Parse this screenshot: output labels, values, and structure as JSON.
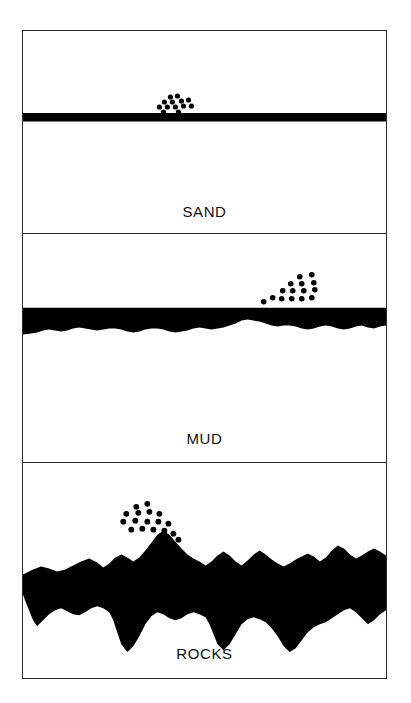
{
  "figure": {
    "background_color": "#ffffff",
    "frame_color": "#2b2b2b",
    "substrate_color": "#000000",
    "organism_color": "#000000",
    "panel_count": 3
  },
  "panels": [
    {
      "id": "sand",
      "label": "SAND",
      "substrate_type": "flat-band",
      "substrate_description": "Straight uniform black band representing a smooth sand bed",
      "organism_count": 13,
      "organism_cluster_position": "upper-center-left",
      "dots": [
        {
          "cx": 169,
          "cy": 96,
          "r": 2.6
        },
        {
          "cx": 176,
          "cy": 95,
          "r": 2.6
        },
        {
          "cx": 163,
          "cy": 101,
          "r": 2.6
        },
        {
          "cx": 171,
          "cy": 101,
          "r": 2.6
        },
        {
          "cx": 180,
          "cy": 100,
          "r": 2.6
        },
        {
          "cx": 187,
          "cy": 99,
          "r": 2.6
        },
        {
          "cx": 158,
          "cy": 106,
          "r": 2.6
        },
        {
          "cx": 166,
          "cy": 106,
          "r": 2.6
        },
        {
          "cx": 174,
          "cy": 106,
          "r": 2.6
        },
        {
          "cx": 182,
          "cy": 105,
          "r": 2.6
        },
        {
          "cx": 190,
          "cy": 105,
          "r": 2.6
        },
        {
          "cx": 162,
          "cy": 111,
          "r": 2.6
        },
        {
          "cx": 177,
          "cy": 111,
          "r": 2.6
        }
      ]
    },
    {
      "id": "mud",
      "label": "MUD",
      "substrate_type": "gently-undulating-band",
      "substrate_description": "Black band with a flat top and a softly rippled lower margin representing mud",
      "organism_count": 15,
      "organism_cluster_position": "right-of-center",
      "dots": [
        {
          "cx": 298,
          "cy": 304,
          "r": 2.8
        },
        {
          "cx": 310,
          "cy": 302,
          "r": 2.8
        },
        {
          "cx": 289,
          "cy": 311,
          "r": 2.8
        },
        {
          "cx": 300,
          "cy": 311,
          "r": 2.8
        },
        {
          "cx": 312,
          "cy": 310,
          "r": 2.8
        },
        {
          "cx": 281,
          "cy": 318,
          "r": 2.8
        },
        {
          "cx": 291,
          "cy": 318,
          "r": 2.8
        },
        {
          "cx": 302,
          "cy": 318,
          "r": 2.8
        },
        {
          "cx": 313,
          "cy": 317,
          "r": 2.8
        },
        {
          "cx": 271,
          "cy": 325,
          "r": 2.8
        },
        {
          "cx": 280,
          "cy": 326,
          "r": 2.8
        },
        {
          "cx": 290,
          "cy": 326,
          "r": 2.8
        },
        {
          "cx": 300,
          "cy": 326,
          "r": 2.8
        },
        {
          "cx": 310,
          "cy": 325,
          "r": 2.8
        },
        {
          "cx": 262,
          "cy": 329,
          "r": 2.8
        }
      ]
    },
    {
      "id": "rocks",
      "label": "ROCKS",
      "substrate_type": "jagged-thick-mass",
      "substrate_description": "Thick, highly irregular black mass with peaks and deep crevices representing a rocky bed",
      "organism_count": 17,
      "organism_cluster_position": "left-of-center above a rock peak",
      "dots": [
        {
          "cx": 135,
          "cy": 534,
          "r": 2.9
        },
        {
          "cx": 146,
          "cy": 531,
          "r": 2.9
        },
        {
          "cx": 125,
          "cy": 541,
          "r": 2.9
        },
        {
          "cx": 137,
          "cy": 540,
          "r": 2.9
        },
        {
          "cx": 148,
          "cy": 539,
          "r": 2.9
        },
        {
          "cx": 158,
          "cy": 541,
          "r": 2.9
        },
        {
          "cx": 122,
          "cy": 549,
          "r": 2.9
        },
        {
          "cx": 134,
          "cy": 548,
          "r": 2.9
        },
        {
          "cx": 146,
          "cy": 549,
          "r": 2.9
        },
        {
          "cx": 157,
          "cy": 549,
          "r": 2.9
        },
        {
          "cx": 167,
          "cy": 551,
          "r": 2.9
        },
        {
          "cx": 130,
          "cy": 557,
          "r": 2.9
        },
        {
          "cx": 141,
          "cy": 556,
          "r": 2.9
        },
        {
          "cx": 152,
          "cy": 557,
          "r": 2.9
        },
        {
          "cx": 163,
          "cy": 558,
          "r": 2.9
        },
        {
          "cx": 172,
          "cy": 561,
          "r": 2.9
        },
        {
          "cx": 177,
          "cy": 567,
          "r": 2.9
        }
      ]
    }
  ],
  "legend_note": "Each panel shows the same organism cluster density over a different seabed substrate type."
}
